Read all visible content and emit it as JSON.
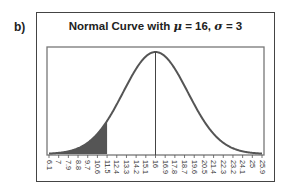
{
  "panel": {
    "label": "b)"
  },
  "chart_data": {
    "type": "area",
    "title": "Normal Curve with μ = 16, σ = 3",
    "title_parts": {
      "prefix": "Normal Curve with ",
      "mu_symbol": "μ",
      "mu_value": " = 16, ",
      "sigma_symbol": "σ",
      "sigma_value": " = 3"
    },
    "distribution": "normal",
    "mean": 16,
    "sd": 3,
    "xlim": [
      6.1,
      25.9
    ],
    "x_ticks": [
      "6.1",
      "7",
      "7.9",
      "8.8",
      "9.7",
      "10.6",
      "11.5",
      "12.4",
      "13.3",
      "14.2",
      "15.1",
      "16",
      "16.9",
      "17.8",
      "18.7",
      "19.6",
      "20.5",
      "21.4",
      "22.3",
      "23.2",
      "24.1",
      "25",
      "25.9"
    ],
    "shaded_region": {
      "from": 6.1,
      "to": 11.5,
      "color": "#555555"
    },
    "mean_line": 16,
    "tick_label_rotation": 90,
    "xlabel": "",
    "ylabel": "",
    "grid": false,
    "legend": null,
    "curve_color": "#555555"
  }
}
